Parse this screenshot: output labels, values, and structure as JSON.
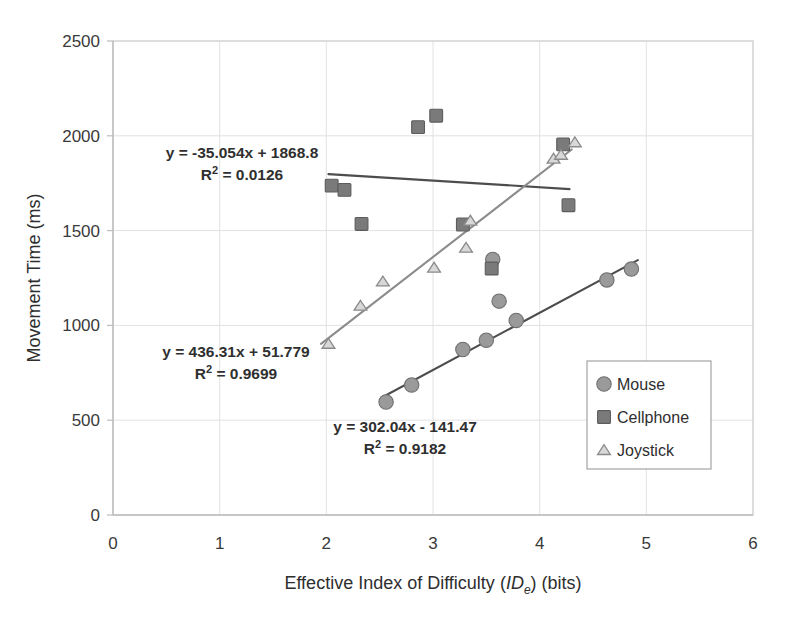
{
  "chart_data": {
    "type": "scatter",
    "title": "",
    "xlabel": "Effective Index of Difficulty (IDe) (bits)",
    "xlabel_parts": {
      "before": "Effective Index of Difficulty (",
      "italic": "ID",
      "subscript": "e",
      "after": ") (bits)"
    },
    "ylabel": "Movement Time (ms)",
    "xlim": [
      0,
      6
    ],
    "ylim": [
      0,
      2500
    ],
    "xticks": [
      "0",
      "1",
      "2",
      "3",
      "4",
      "5",
      "6"
    ],
    "xtick_values": [
      0,
      1,
      2,
      3,
      4,
      5,
      6
    ],
    "yticks": [
      "0",
      "500",
      "1000",
      "1500",
      "2000",
      "2500"
    ],
    "ytick_values": [
      0,
      500,
      1000,
      1500,
      2000,
      2500
    ],
    "grid": true,
    "legend_position": "inside-lower-right",
    "series": [
      {
        "name": "Mouse",
        "marker": "circle",
        "color": "#9a9a9a",
        "edge_color": "#6f6f6f",
        "trendline_color": "#4d4d4d",
        "points": [
          {
            "x": 2.56,
            "y": 596
          },
          {
            "x": 2.8,
            "y": 686
          },
          {
            "x": 3.28,
            "y": 873
          },
          {
            "x": 3.5,
            "y": 922
          },
          {
            "x": 3.56,
            "y": 1348
          },
          {
            "x": 3.62,
            "y": 1128
          },
          {
            "x": 3.78,
            "y": 1026
          },
          {
            "x": 4.63,
            "y": 1240
          },
          {
            "x": 4.86,
            "y": 1297
          }
        ],
        "fit": {
          "equation": "y = 302.04x - 141.47",
          "r2_label": "R² = 0.9182",
          "slope": 302.04,
          "intercept": -141.47,
          "r2": 0.9182,
          "x_start": 2.52,
          "x_end": 4.92
        }
      },
      {
        "name": "Cellphone",
        "marker": "square",
        "color": "#7a7a7a",
        "edge_color": "#5c5c5c",
        "trendline_color": "#4d4d4d",
        "points": [
          {
            "x": 2.05,
            "y": 1737
          },
          {
            "x": 2.17,
            "y": 1715
          },
          {
            "x": 2.33,
            "y": 1535
          },
          {
            "x": 2.86,
            "y": 2046
          },
          {
            "x": 3.03,
            "y": 2106
          },
          {
            "x": 3.28,
            "y": 1532
          },
          {
            "x": 3.55,
            "y": 1300
          },
          {
            "x": 4.22,
            "y": 1955
          },
          {
            "x": 4.27,
            "y": 1634
          }
        ],
        "fit": {
          "equation": "y = -35.054x + 1868.8",
          "r2_label": "R² = 0.0126",
          "slope": -35.054,
          "intercept": 1868.8,
          "r2": 0.0126,
          "x_start": 2.02,
          "x_end": 4.28
        }
      },
      {
        "name": "Joystick",
        "marker": "triangle",
        "color": "#d8d8d8",
        "edge_color": "#8a8a8a",
        "trendline_color": "#8c8c8c",
        "points": [
          {
            "x": 2.02,
            "y": 903
          },
          {
            "x": 2.32,
            "y": 1104
          },
          {
            "x": 2.53,
            "y": 1232
          },
          {
            "x": 3.01,
            "y": 1305
          },
          {
            "x": 3.31,
            "y": 1410
          },
          {
            "x": 3.35,
            "y": 1553
          },
          {
            "x": 4.13,
            "y": 1880
          },
          {
            "x": 4.2,
            "y": 1900
          },
          {
            "x": 4.33,
            "y": 1966
          }
        ],
        "fit": {
          "equation": "y = 436.31x + 51.779",
          "r2_label": "R² = 0.9699",
          "slope": 436.31,
          "intercept": 51.779,
          "r2": 0.9699,
          "x_start": 1.95,
          "x_end": 4.3
        }
      }
    ],
    "annotations": [
      {
        "id": "cellphone-eq",
        "line1": "y = -35.054x + 1868.8",
        "line2_base": "R",
        "line2_sup": "2",
        "line2_rest": " = 0.0126",
        "x": 242,
        "y": 158
      },
      {
        "id": "joystick-eq",
        "line1": "y = 436.31x + 51.779",
        "line2_base": "R",
        "line2_sup": "2",
        "line2_rest": " = 0.9699",
        "x": 236,
        "y": 357
      },
      {
        "id": "mouse-eq",
        "line1": "y = 302.04x - 141.47",
        "line2_base": "R",
        "line2_sup": "2",
        "line2_rest": " = 0.9182",
        "x": 405,
        "y": 432
      }
    ],
    "legend": {
      "entries": [
        "Mouse",
        "Cellphone",
        "Joystick"
      ]
    }
  },
  "colors": {
    "background": "#ffffff",
    "grid": "#e2e2e2",
    "axis": "#d0d0d0",
    "text": "#2e2e2e"
  }
}
